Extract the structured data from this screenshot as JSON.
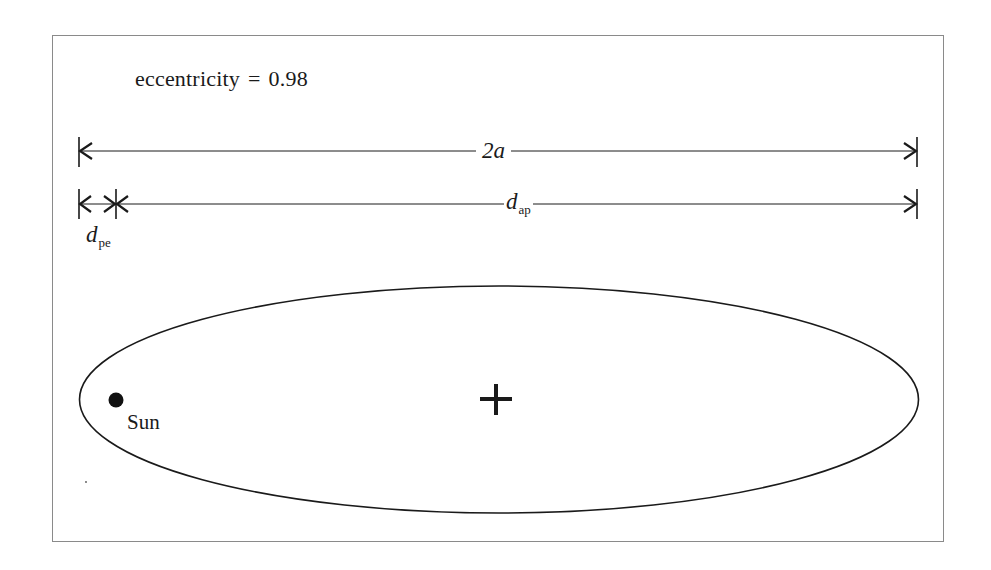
{
  "diagram": {
    "type": "orbital-ellipse",
    "eccentricity_label": "eccentricity",
    "equals": "=",
    "eccentricity_value": "0.98",
    "dimensions": {
      "major_axis": {
        "label": "2a"
      },
      "aphelion": {
        "symbol": "d",
        "subscript": "ap"
      },
      "perihelion": {
        "symbol": "d",
        "subscript": "pe"
      }
    },
    "focus": {
      "label": "Sun"
    },
    "center_marker": "+",
    "colors": {
      "line": "#1a1a1a",
      "frame": "#8a8a8a",
      "background": "#ffffff"
    }
  }
}
